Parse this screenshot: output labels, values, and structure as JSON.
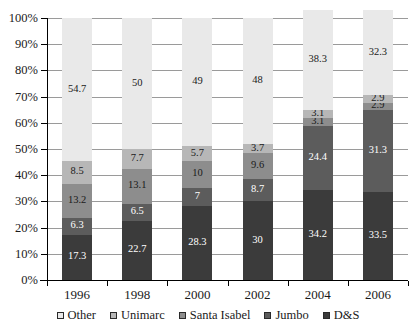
{
  "chart_data": {
    "type": "bar",
    "stacked": true,
    "stacked_mode": "percent",
    "title": "",
    "subtitle": "",
    "xlabel": "",
    "ylabel": "",
    "categories": [
      "1996",
      "1998",
      "2000",
      "2002",
      "2004",
      "2006"
    ],
    "ylim": [
      0,
      100
    ],
    "ytick_labels": [
      "0%",
      "10%",
      "20%",
      "30%",
      "40%",
      "50%",
      "60%",
      "70%",
      "80%",
      "90%",
      "100%"
    ],
    "ytick_values": [
      0,
      10,
      20,
      30,
      40,
      50,
      60,
      70,
      80,
      90,
      100
    ],
    "grid": true,
    "grid_axis": "y",
    "legend_position": "bottom",
    "stack_order_bottom_to_top": [
      "D&S",
      "Jumbo",
      "Santa Isabel",
      "Unimarc",
      "Other"
    ],
    "series": [
      {
        "name": "D&S",
        "color": "#3b3b3b",
        "label_color": "#ffffff",
        "values": [
          17.3,
          22.7,
          28.3,
          30,
          34.2,
          33.5
        ],
        "labels": [
          "17.3",
          "22.7",
          "28.3",
          "30",
          "34.2",
          "33.5"
        ]
      },
      {
        "name": "Jumbo",
        "color": "#5c5c5c",
        "label_color": "#ffffff",
        "values": [
          6.3,
          6.5,
          7,
          8.7,
          24.4,
          31.3
        ],
        "labels": [
          "6.3",
          "6.5",
          "7",
          "8.7",
          "24.4",
          "31.3"
        ]
      },
      {
        "name": "Santa Isabel",
        "color": "#8d8d8d",
        "label_color": "#1a1a1a",
        "values": [
          13.2,
          13.1,
          10,
          9.6,
          3.1,
          2.9
        ],
        "labels": [
          "13.2",
          "13.1",
          "10",
          "9.6",
          "3.1",
          "2.9"
        ]
      },
      {
        "name": "Unimarc",
        "color": "#b7b7b7",
        "label_color": "#1a1a1a",
        "values": [
          8.5,
          7.7,
          5.7,
          3.7,
          3.1,
          2.9
        ],
        "labels": [
          "8.5",
          "7.7",
          "5.7",
          "3.7",
          "3.1",
          "2.9"
        ]
      },
      {
        "name": "Other",
        "color": "#e9e9e9",
        "label_color": "#1a1a1a",
        "values": [
          54.7,
          50,
          49,
          48,
          38.3,
          32.3
        ],
        "labels": [
          "54.7",
          "50",
          "49",
          "48",
          "38.3",
          "32.3"
        ]
      }
    ]
  },
  "legend": {
    "items": [
      {
        "label": "Other",
        "color": "#e9e9e9"
      },
      {
        "label": "Unimarc",
        "color": "#b7b7b7"
      },
      {
        "label": "Santa Isabel",
        "color": "#8d8d8d"
      },
      {
        "label": "Jumbo",
        "color": "#5c5c5c"
      },
      {
        "label": "D&S",
        "color": "#3b3b3b"
      }
    ]
  }
}
